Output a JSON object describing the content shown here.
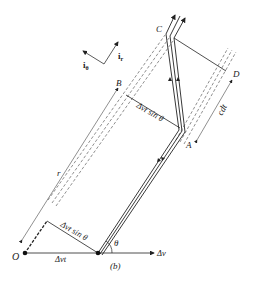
{
  "figure": {
    "caption": "(b)",
    "points": {
      "O": "O",
      "A": "A",
      "B": "B",
      "C": "C",
      "D": "D"
    },
    "labels": {
      "r": "r",
      "c_dt": "cdt",
      "dv_r_sin_theta_top": "Δvt sin θ",
      "dv_r_sin_theta_bottom": "Δvt sin θ",
      "dv_t": "Δvt",
      "dv": "Δv",
      "theta": "θ",
      "i_r": "i",
      "i_r_sub": "r",
      "i_theta": "i",
      "i_theta_sub": "θ"
    },
    "colors": {
      "ink": "#222222",
      "background": "#ffffff"
    }
  }
}
